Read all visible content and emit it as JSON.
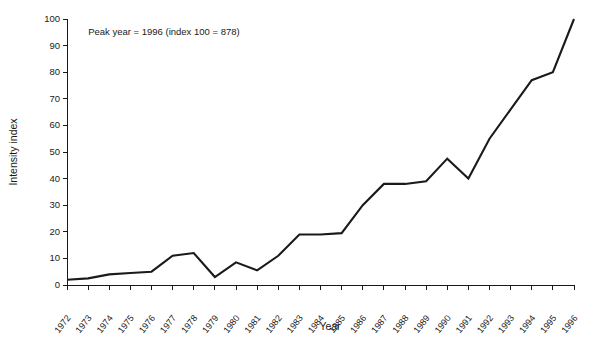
{
  "chart_data": {
    "type": "line",
    "title": "",
    "subtitle": "",
    "xlabel": "Year",
    "ylabel": "Intensity index",
    "xlim": [
      1972,
      1996
    ],
    "ylim": [
      0,
      100
    ],
    "grid": false,
    "legend": false,
    "legend_position": "none",
    "annotations": [
      {
        "name": "peak-year-note",
        "text": "Peak year = 1996 (index 100 = 878)",
        "x": 1973.0,
        "y": 94
      }
    ],
    "line_color": "#1a1a1a",
    "categories": [
      "1972",
      "1973",
      "1974",
      "1975",
      "1976",
      "1977",
      "1978",
      "1979",
      "1980",
      "1981",
      "1982",
      "1983",
      "1984",
      "1985",
      "1986",
      "1987",
      "1988",
      "1989",
      "1990",
      "1991",
      "1992",
      "1993",
      "1994",
      "1995",
      "1996"
    ],
    "x": [
      1972,
      1973,
      1974,
      1975,
      1976,
      1977,
      1978,
      1979,
      1980,
      1981,
      1982,
      1983,
      1984,
      1985,
      1986,
      1987,
      1988,
      1989,
      1990,
      1991,
      1992,
      1993,
      1994,
      1995,
      1996
    ],
    "values": [
      2,
      2.5,
      4,
      4.5,
      5,
      11,
      12,
      3,
      8.5,
      5.5,
      11,
      19,
      19,
      19.5,
      30,
      38,
      38,
      39,
      47.5,
      40,
      55,
      66,
      77,
      80,
      100
    ],
    "ytick_labels": [
      "0",
      "10",
      "20",
      "30",
      "40",
      "50",
      "60",
      "70",
      "80",
      "90",
      "100"
    ],
    "ytick_values": [
      0,
      10,
      20,
      30,
      40,
      50,
      60,
      70,
      80,
      90,
      100
    ],
    "series": [
      {
        "name": "Intensity index",
        "values": [
          2,
          2.5,
          4,
          4.5,
          5,
          11,
          12,
          3,
          8.5,
          5.5,
          11,
          19,
          19,
          19.5,
          30,
          38,
          38,
          39,
          47.5,
          40,
          55,
          66,
          77,
          80,
          100
        ]
      }
    ]
  }
}
